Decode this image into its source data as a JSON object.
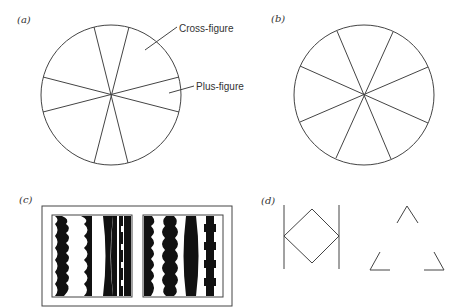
{
  "panels": {
    "a": {
      "label": "(a)"
    },
    "b": {
      "label": "(b)"
    },
    "c": {
      "label": "(c)"
    },
    "d": {
      "label": "(d)"
    }
  },
  "callouts": {
    "cross_figure": "Cross-figure",
    "plus_figure": "Plus-figure"
  },
  "colors": {
    "line": "#444444",
    "fill": "#111111",
    "background": "#ffffff"
  }
}
